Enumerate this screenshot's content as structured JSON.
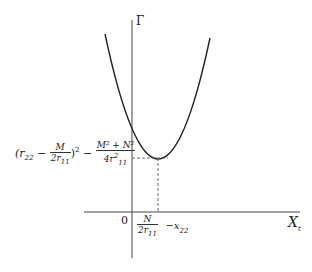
{
  "diagram": {
    "y_axis_label": "Γ",
    "x_axis_label": "X",
    "x_axis_label_sub": "t",
    "origin_label": "0",
    "min_y_label": {
      "part1_open": "(r",
      "part1_sub": "22",
      "part1_minus": " − ",
      "frac1_num": "M",
      "frac1_den": "2r",
      "frac1_den_sub": "11",
      "part1_close": ")",
      "part1_exp": "2",
      "part2_minus": " − ",
      "frac2_num": "M² + N²",
      "frac2_den": "4r",
      "frac2_den_sup": "2",
      "frac2_den_sub": "11"
    },
    "min_x_label": {
      "frac_num": "N",
      "frac_den": "2r",
      "frac_den_sub": "11",
      "tail": "−x",
      "tail_sub": "22"
    },
    "curve": "parabola",
    "colors": {
      "line": "#333333",
      "dashed": "#666666"
    }
  }
}
